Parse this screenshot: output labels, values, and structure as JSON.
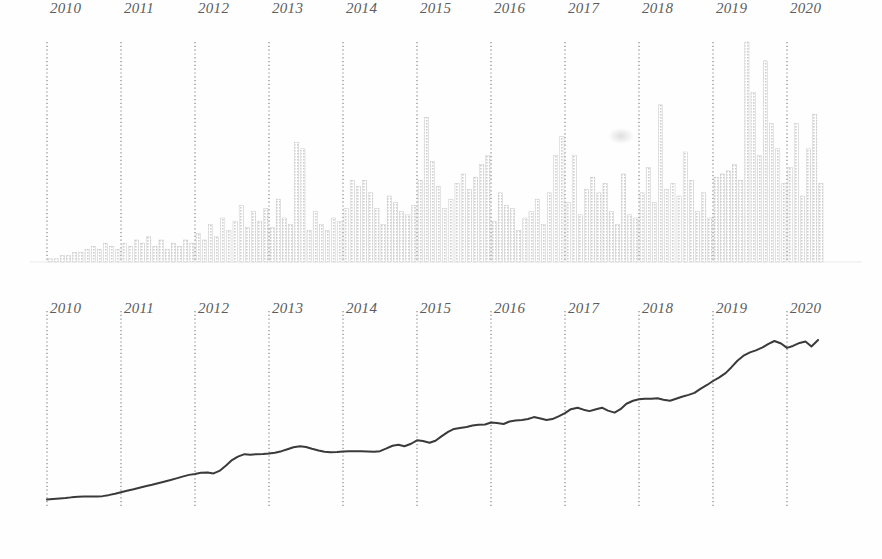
{
  "figure": {
    "title": "",
    "background_color": "#ffffff",
    "panels": [
      {
        "name": "monthly-bars",
        "type": "bar"
      },
      {
        "name": "cumulative-line",
        "type": "line"
      }
    ]
  },
  "axis": {
    "tick_labels": [
      "2010",
      "2011",
      "2012",
      "2013",
      "2014",
      "2015",
      "2016",
      "2017",
      "2018",
      "2019",
      "2020"
    ],
    "tick_values": [
      2010,
      2011,
      2012,
      2013,
      2014,
      2015,
      2016,
      2017,
      2018,
      2019,
      2020
    ],
    "gridline_color": "#6b6b6b",
    "gridline_style": "dotted",
    "label_color": "#5c5c5c",
    "label_style": "italic-serif"
  },
  "chart_data": [
    {
      "type": "bar",
      "title": "",
      "xlabel": "",
      "ylabel": "",
      "xlim": [
        2009.75,
        2020.55
      ],
      "ylim": [
        0,
        100
      ],
      "grid": true,
      "legend": "none",
      "bar_color": "#cfcfcf",
      "bar_edge_color": "#bdbdbd",
      "categories": [
        "2010-01",
        "2010-02",
        "2010-03",
        "2010-04",
        "2010-05",
        "2010-06",
        "2010-07",
        "2010-08",
        "2010-09",
        "2010-10",
        "2010-11",
        "2010-12",
        "2011-01",
        "2011-02",
        "2011-03",
        "2011-04",
        "2011-05",
        "2011-06",
        "2011-07",
        "2011-08",
        "2011-09",
        "2011-10",
        "2011-11",
        "2011-12",
        "2012-01",
        "2012-02",
        "2012-03",
        "2012-04",
        "2012-05",
        "2012-06",
        "2012-07",
        "2012-08",
        "2012-09",
        "2012-10",
        "2012-11",
        "2012-12",
        "2013-01",
        "2013-02",
        "2013-03",
        "2013-04",
        "2013-05",
        "2013-06",
        "2013-07",
        "2013-08",
        "2013-09",
        "2013-10",
        "2013-11",
        "2013-12",
        "2014-01",
        "2014-02",
        "2014-03",
        "2014-04",
        "2014-05",
        "2014-06",
        "2014-07",
        "2014-08",
        "2014-09",
        "2014-10",
        "2014-11",
        "2014-12",
        "2015-01",
        "2015-02",
        "2015-03",
        "2015-04",
        "2015-05",
        "2015-06",
        "2015-07",
        "2015-08",
        "2015-09",
        "2015-10",
        "2015-11",
        "2015-12",
        "2016-01",
        "2016-02",
        "2016-03",
        "2016-04",
        "2016-05",
        "2016-06",
        "2016-07",
        "2016-08",
        "2016-09",
        "2016-10",
        "2016-11",
        "2016-12",
        "2017-01",
        "2017-02",
        "2017-03",
        "2017-04",
        "2017-05",
        "2017-06",
        "2017-07",
        "2017-08",
        "2017-09",
        "2017-10",
        "2017-11",
        "2017-12",
        "2018-01",
        "2018-02",
        "2018-03",
        "2018-04",
        "2018-05",
        "2018-06",
        "2018-07",
        "2018-08",
        "2018-09",
        "2018-10",
        "2018-11",
        "2018-12",
        "2019-01",
        "2019-02",
        "2019-03",
        "2019-04",
        "2019-05",
        "2019-06",
        "2019-07",
        "2019-08",
        "2019-09",
        "2019-10",
        "2019-11",
        "2019-12",
        "2020-01",
        "2020-02",
        "2020-03",
        "2020-04",
        "2020-05",
        "2020-06"
      ],
      "values": [
        1,
        1,
        2,
        2,
        3,
        3,
        4,
        5,
        4,
        6,
        5,
        4,
        6,
        5,
        7,
        6,
        8,
        5,
        7,
        4,
        6,
        5,
        7,
        6,
        9,
        7,
        12,
        8,
        14,
        10,
        13,
        18,
        11,
        16,
        13,
        17,
        11,
        20,
        14,
        12,
        38,
        36,
        10,
        16,
        12,
        10,
        14,
        13,
        17,
        26,
        24,
        26,
        22,
        17,
        12,
        21,
        19,
        16,
        15,
        18,
        26,
        46,
        32,
        24,
        17,
        20,
        25,
        28,
        23,
        27,
        31,
        34,
        13,
        22,
        18,
        17,
        10,
        14,
        16,
        20,
        12,
        22,
        34,
        40,
        19,
        34,
        15,
        23,
        27,
        22,
        25,
        16,
        12,
        28,
        15,
        14,
        22,
        30,
        19,
        50,
        23,
        25,
        21,
        35,
        26,
        16,
        22,
        14,
        27,
        28,
        29,
        31,
        26,
        70,
        54,
        34,
        64,
        44,
        36,
        25,
        30,
        44,
        21,
        36,
        47,
        25
      ]
    },
    {
      "type": "line",
      "title": "",
      "xlabel": "",
      "ylabel": "",
      "xlim": [
        2009.75,
        2020.55
      ],
      "ylim": [
        0,
        100
      ],
      "grid": true,
      "legend": "none",
      "line_color": "#3a3a3a",
      "line_width": 2,
      "x": [
        2010.0,
        2010.08,
        2010.17,
        2010.25,
        2010.33,
        2010.42,
        2010.5,
        2010.58,
        2010.67,
        2010.75,
        2010.83,
        2010.92,
        2011.0,
        2011.08,
        2011.17,
        2011.25,
        2011.33,
        2011.42,
        2011.5,
        2011.58,
        2011.67,
        2011.75,
        2011.83,
        2011.92,
        2012.0,
        2012.08,
        2012.17,
        2012.25,
        2012.33,
        2012.42,
        2012.5,
        2012.58,
        2012.67,
        2012.75,
        2012.83,
        2012.92,
        2013.0,
        2013.08,
        2013.17,
        2013.25,
        2013.33,
        2013.42,
        2013.5,
        2013.58,
        2013.67,
        2013.75,
        2013.83,
        2013.92,
        2014.0,
        2014.08,
        2014.17,
        2014.25,
        2014.33,
        2014.42,
        2014.5,
        2014.58,
        2014.67,
        2014.75,
        2014.83,
        2014.92,
        2015.0,
        2015.08,
        2015.17,
        2015.25,
        2015.33,
        2015.42,
        2015.5,
        2015.58,
        2015.67,
        2015.75,
        2015.83,
        2015.92,
        2016.0,
        2016.08,
        2016.17,
        2016.25,
        2016.33,
        2016.42,
        2016.5,
        2016.58,
        2016.67,
        2016.75,
        2016.83,
        2016.92,
        2017.0,
        2017.08,
        2017.17,
        2017.25,
        2017.33,
        2017.42,
        2017.5,
        2017.58,
        2017.67,
        2017.75,
        2017.83,
        2017.92,
        2018.0,
        2018.08,
        2018.17,
        2018.25,
        2018.33,
        2018.42,
        2018.5,
        2018.58,
        2018.67,
        2018.75,
        2018.83,
        2018.92,
        2019.0,
        2019.08,
        2019.17,
        2019.25,
        2019.33,
        2019.42,
        2019.5,
        2019.58,
        2019.67,
        2019.75,
        2019.83,
        2019.92,
        2020.0,
        2020.08,
        2020.17,
        2020.25,
        2020.33,
        2020.42
      ],
      "values": [
        3.0,
        3.2,
        3.4,
        3.6,
        3.9,
        4.1,
        4.2,
        4.2,
        4.3,
        4.4,
        4.8,
        5.4,
        6.0,
        6.6,
        7.2,
        7.8,
        8.4,
        9.0,
        9.6,
        10.2,
        10.9,
        11.6,
        12.3,
        13.0,
        13.4,
        13.9,
        14.0,
        13.6,
        14.6,
        16.8,
        19.0,
        20.4,
        21.4,
        21.2,
        21.4,
        21.5,
        21.7,
        22.0,
        22.6,
        23.4,
        24.2,
        24.6,
        24.3,
        23.6,
        22.9,
        22.4,
        22.2,
        22.3,
        22.5,
        22.6,
        22.6,
        22.6,
        22.5,
        22.4,
        22.6,
        23.6,
        24.8,
        25.2,
        24.6,
        25.6,
        27.0,
        26.7,
        26.0,
        26.8,
        28.6,
        30.4,
        31.6,
        32.0,
        32.4,
        33.0,
        33.3,
        33.4,
        34.2,
        34.0,
        33.6,
        34.6,
        35.0,
        35.2,
        35.6,
        36.4,
        35.8,
        35.2,
        35.6,
        36.8,
        38.0,
        39.6,
        40.2,
        39.4,
        38.8,
        39.6,
        40.2,
        39.0,
        38.2,
        39.6,
        41.8,
        43.0,
        43.6,
        43.8,
        43.8,
        44.0,
        43.4,
        43.0,
        43.8,
        44.6,
        45.4,
        46.2,
        47.8,
        49.4,
        51.0,
        52.4,
        54.2,
        56.6,
        59.2,
        61.4,
        62.6,
        63.4,
        64.6,
        66.0,
        67.2,
        66.2,
        64.4,
        65.2,
        66.4,
        67.0,
        65.0,
        67.6
      ]
    }
  ],
  "artifacts": [
    {
      "name": "scan-smudge",
      "x": 608,
      "y": 128
    }
  ]
}
